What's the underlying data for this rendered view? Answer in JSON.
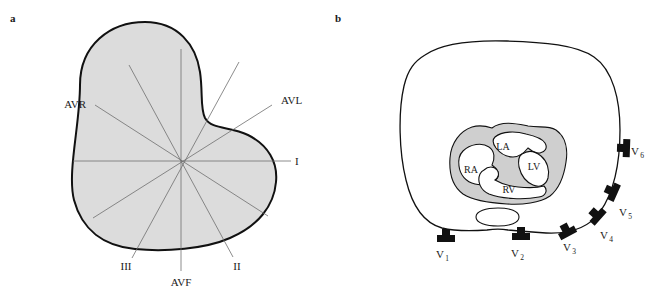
{
  "figure": {
    "panels": [
      {
        "letter": "a",
        "name": "hexaxial-limb-lead-reference-system",
        "leads": [
          {
            "id": "I",
            "label": "I"
          },
          {
            "id": "II",
            "label": "II"
          },
          {
            "id": "III",
            "label": "III"
          },
          {
            "id": "AVR",
            "label": "AVR"
          },
          {
            "id": "AVL",
            "label": "AVL"
          },
          {
            "id": "AVF",
            "label": "AVF"
          }
        ]
      },
      {
        "letter": "b",
        "name": "precordial-chest-lead-cross-section",
        "chambers": [
          {
            "id": "RA",
            "label": "RA"
          },
          {
            "id": "LA",
            "label": "LA"
          },
          {
            "id": "RV",
            "label": "RV"
          },
          {
            "id": "LV",
            "label": "LV"
          }
        ],
        "electrodes": [
          {
            "id": "V1",
            "label": "V",
            "sub": "1"
          },
          {
            "id": "V2",
            "label": "V",
            "sub": "2"
          },
          {
            "id": "V3",
            "label": "V",
            "sub": "3"
          },
          {
            "id": "V4",
            "label": "V",
            "sub": "4"
          },
          {
            "id": "V5",
            "label": "V",
            "sub": "5"
          },
          {
            "id": "V6",
            "label": "V",
            "sub": "6"
          }
        ]
      }
    ]
  },
  "colors": {
    "torso_fill_a": "#dcdcdc",
    "torso_fill_b": "#ffffff",
    "myocardium_fill": "#cfcfcf",
    "chamber_fill": "#ffffff",
    "outline": "#111111",
    "axis_line": "#6e6e6e",
    "electrode": "#111111",
    "text": "#1a1a1a",
    "background": "#ffffff"
  }
}
